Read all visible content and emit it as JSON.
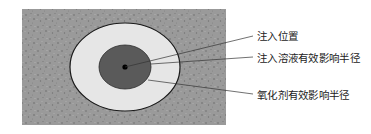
{
  "diagram": {
    "type": "concentric-influence-radius",
    "colors": {
      "background": "#ffffff",
      "soil": "#9a9a9a",
      "soil_speckle": "#6e6e6e",
      "outer_zone": "#e6e6e6",
      "inner_zone": "#5a5a5a",
      "outline": "#1a1a1a",
      "center_point": "#000000",
      "leader_line": "#333333"
    },
    "labels": [
      {
        "id": "injection-point",
        "text": "注入位置"
      },
      {
        "id": "solution-radius",
        "text": "注入溶液有效影响半径"
      },
      {
        "id": "oxidant-radius",
        "text": "氧化剂有效影响半径"
      }
    ]
  }
}
